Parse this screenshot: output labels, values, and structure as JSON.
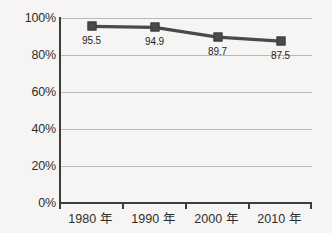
{
  "chart_data": {
    "type": "line",
    "title": "",
    "subtitle": "",
    "xlabel": "",
    "ylabel": "",
    "categories": [
      "1980 年",
      "1990 年",
      "2000 年",
      "2010 年"
    ],
    "values": [
      95.5,
      94.9,
      89.7,
      87.5
    ],
    "point_labels": [
      "95.5",
      "94.9",
      "89.7",
      "87.5"
    ],
    "series": [
      {
        "name": "",
        "values": [
          95.5,
          94.9,
          89.7,
          87.5
        ],
        "color": "#4a4a4a",
        "marker": "square"
      }
    ],
    "ylim": [
      0,
      100
    ],
    "y_ticks": [
      0,
      20,
      40,
      60,
      80,
      100
    ],
    "y_tick_labels": [
      "0%",
      "20%",
      "40%",
      "60%",
      "80%",
      "100%"
    ],
    "grid": true,
    "grid_axis": "y",
    "legend": false,
    "legend_position": "none"
  },
  "colors": {
    "background": "#f6f5f3",
    "series_line": "#4a4a4a",
    "marker_fill": "#4a4a4a",
    "gridline": "#b9b9b9",
    "axis": "#3d3d3d",
    "text": "#2e2e2e"
  }
}
